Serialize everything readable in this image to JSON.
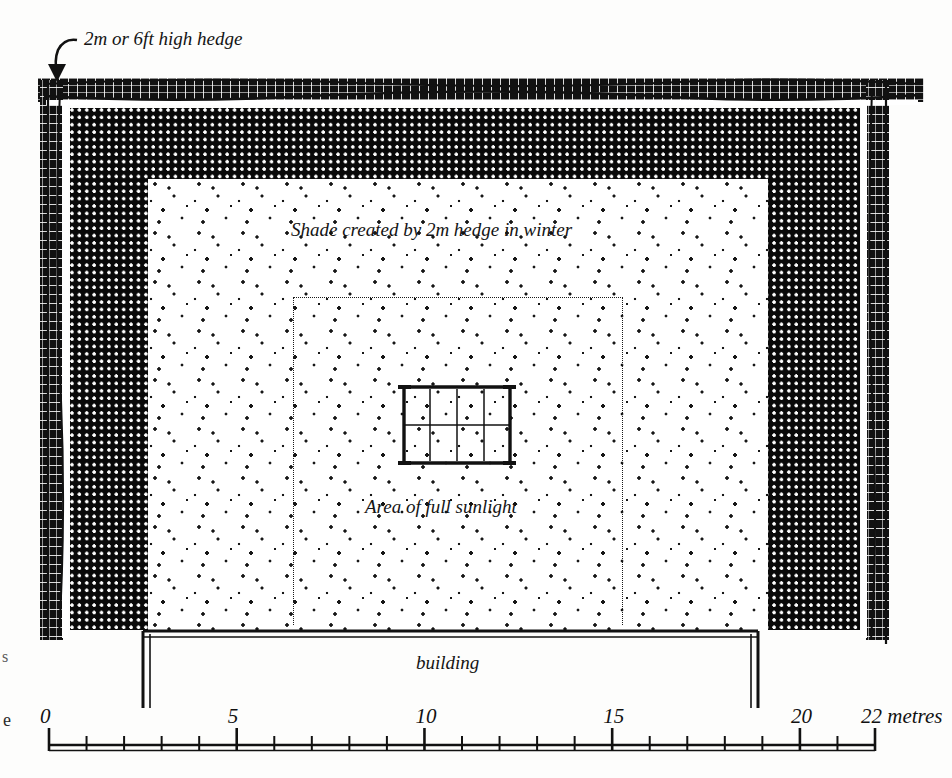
{
  "figure": {
    "type": "garden-shade-plan-diagram",
    "labels": {
      "hedge": "2m or 6ft high hedge",
      "shade": "Shade created by 2m hedge in winter",
      "sunlight": "Area of full sunlight",
      "building": "building"
    },
    "icons": {
      "hedge_pointer": "curved-arrow-icon",
      "plot_grid": "garden-plot-grid-icon"
    },
    "colors": {
      "ink": "#111111",
      "paper": "#ffffff",
      "dark_shade_fill": "#090909",
      "light_stipple_dot": "#161616"
    }
  },
  "scale": {
    "unit_label": "22 metres",
    "ticks": [
      {
        "value": "0",
        "major": true
      },
      {
        "value": "1",
        "major": false
      },
      {
        "value": "2",
        "major": false
      },
      {
        "value": "3",
        "major": false
      },
      {
        "value": "4",
        "major": false
      },
      {
        "value": "5",
        "major": true
      },
      {
        "value": "6",
        "major": false
      },
      {
        "value": "7",
        "major": false
      },
      {
        "value": "8",
        "major": false
      },
      {
        "value": "9",
        "major": false
      },
      {
        "value": "10",
        "major": true
      },
      {
        "value": "11",
        "major": false
      },
      {
        "value": "12",
        "major": false
      },
      {
        "value": "13",
        "major": false
      },
      {
        "value": "14",
        "major": false
      },
      {
        "value": "15",
        "major": true
      },
      {
        "value": "16",
        "major": false
      },
      {
        "value": "17",
        "major": false
      },
      {
        "value": "18",
        "major": false
      },
      {
        "value": "19",
        "major": false
      },
      {
        "value": "20",
        "major": true
      },
      {
        "value": "21",
        "major": false
      },
      {
        "value": "22",
        "major": true
      }
    ],
    "numbered": [
      {
        "value": "0",
        "metre": 0
      },
      {
        "value": "5",
        "metre": 5
      },
      {
        "value": "10",
        "metre": 10
      },
      {
        "value": "15",
        "metre": 15
      },
      {
        "value": "20",
        "metre": 20
      },
      {
        "value": "22 metres",
        "metre": 22
      }
    ]
  },
  "page_edge_fragments": {
    "upper": "s",
    "lower": "e"
  }
}
